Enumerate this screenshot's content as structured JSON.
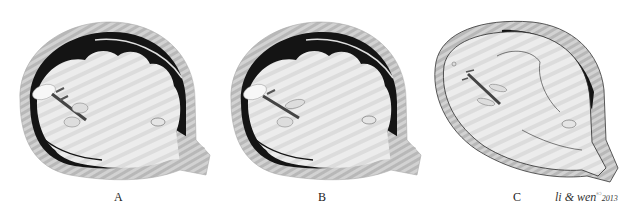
{
  "figure": {
    "panels": [
      {
        "label": "A",
        "left": 0,
        "label_x": 114
      },
      {
        "label": "B",
        "left": 211,
        "label_x": 318
      },
      {
        "label": "C",
        "left": 422,
        "label_x": 513
      }
    ],
    "credit": {
      "text": "li & wen",
      "symbol": "©",
      "year": "2013"
    },
    "colors": {
      "skull_band": "#c9c9c9",
      "dark_space": "#141414",
      "brain_fill": "#e9e9e9",
      "outline": "#2a2a2a"
    }
  }
}
